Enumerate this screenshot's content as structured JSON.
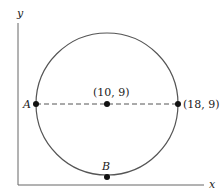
{
  "diagram": {
    "axes": {
      "x_label": "x",
      "y_label": "y"
    },
    "circle": {
      "center_label": "(10, 9)",
      "center": [
        10,
        9
      ],
      "radius": 8
    },
    "points": [
      {
        "name": "A",
        "label": "A"
      },
      {
        "name": "center",
        "label": "(10, 9)"
      },
      {
        "name": "right",
        "label": "(18, 9)"
      },
      {
        "name": "B",
        "label": "B"
      }
    ],
    "colors": {
      "line": "#555555",
      "dot": "#111111"
    }
  }
}
